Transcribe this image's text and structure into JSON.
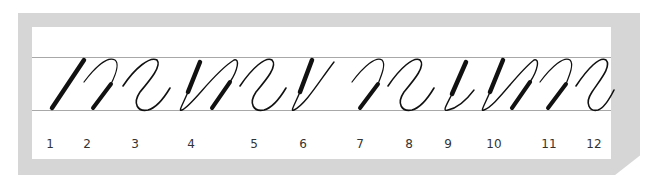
{
  "diagram": {
    "type": "calligraphy-stroke-progression",
    "guide_lines": {
      "top_y": 57,
      "bottom_y": 110,
      "color": "#a8a8a8"
    },
    "frame_color": "#d6d6d6",
    "ink_color": "#111111",
    "steps": [
      {
        "label": "1",
        "x": 50
      },
      {
        "label": "2",
        "x": 87
      },
      {
        "label": "3",
        "x": 135
      },
      {
        "label": "4",
        "x": 191
      },
      {
        "label": "5",
        "x": 254
      },
      {
        "label": "6",
        "x": 303
      },
      {
        "label": "7",
        "x": 360
      },
      {
        "label": "8",
        "x": 409
      },
      {
        "label": "9",
        "x": 448
      },
      {
        "label": "10",
        "x": 494
      },
      {
        "label": "11",
        "x": 549
      },
      {
        "label": "12",
        "x": 594
      }
    ]
  }
}
